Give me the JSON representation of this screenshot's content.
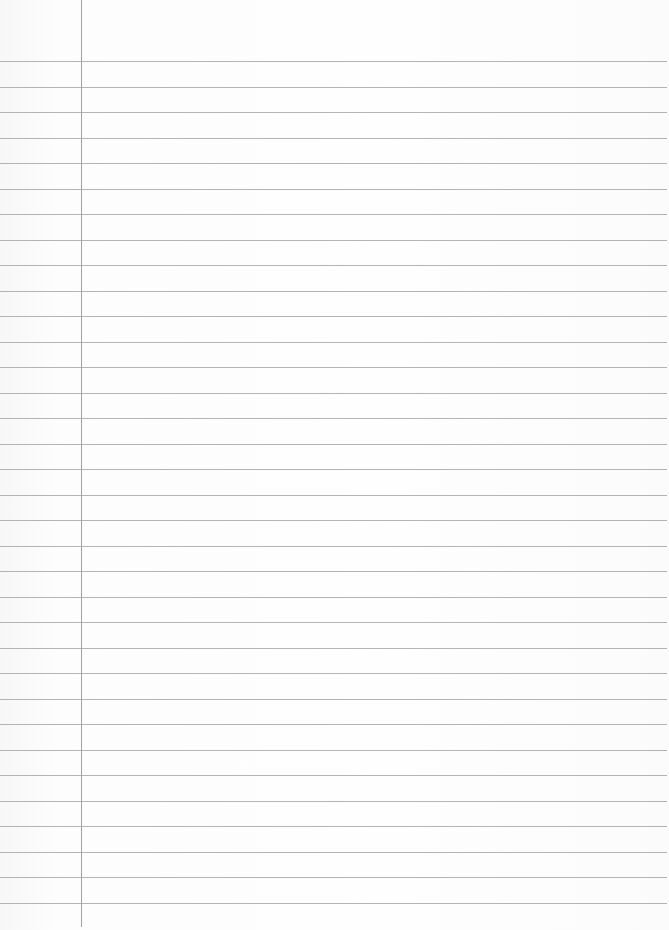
{
  "page": {
    "type": "lined-notebook-paper",
    "background_color": "#fbfbfb",
    "rule_color": "#b4b4b4",
    "margin_color": "#a2a2a2",
    "margin_x": 81,
    "first_rule_y": 61,
    "rule_spacing": 25.5,
    "rule_count": 34,
    "text": ""
  }
}
